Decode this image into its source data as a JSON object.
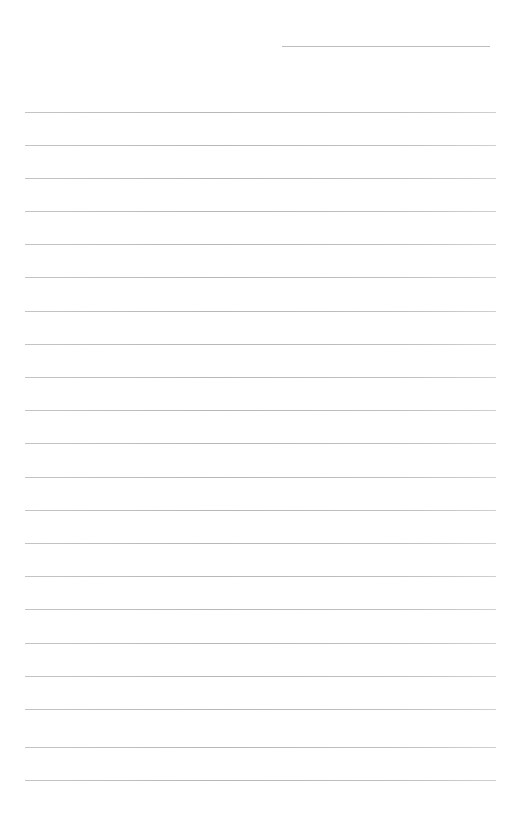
{
  "page": {
    "type": "blank-ruled-sheet",
    "background_color": "#ffffff",
    "line_color": "#bdbdbd"
  },
  "header_line": {
    "x1": 282,
    "x2": 490,
    "y": 46
  },
  "ruled_lines": {
    "x1": 25,
    "x2": 496,
    "y_positions": [
      112,
      145,
      178,
      211,
      244,
      277,
      311,
      344,
      377,
      410,
      443,
      477,
      510,
      543,
      576,
      609,
      643,
      676,
      709,
      747,
      780
    ]
  }
}
